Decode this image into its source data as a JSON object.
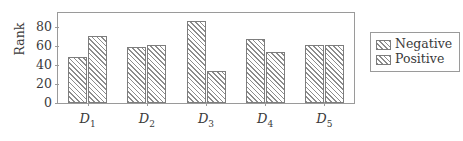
{
  "chart_data": {
    "type": "bar",
    "title": "",
    "xlabel": "",
    "ylabel": "Rank",
    "categories": [
      "D1",
      "D2",
      "D3",
      "D4",
      "D5"
    ],
    "category_labels": [
      "D",
      "D",
      "D",
      "D",
      "D"
    ],
    "category_subscripts": [
      "1",
      "2",
      "3",
      "4",
      "5"
    ],
    "series": [
      {
        "name": "Negative",
        "values": [
          49,
          59,
          87,
          68,
          61
        ]
      },
      {
        "name": "Positive",
        "values": [
          71,
          61,
          34,
          54,
          61
        ]
      }
    ],
    "ylim": [
      0,
      95
    ],
    "yticks": [
      0,
      20,
      40,
      60,
      80
    ],
    "ytick_labels": [
      "0",
      "20",
      "40",
      "60",
      "80"
    ],
    "grid": false,
    "legend_position": "right-outside",
    "legend_entries": [
      "Negative",
      "Positive"
    ],
    "frame_color": "#9a9a9a",
    "bar_edge_color": "#7d7d7d",
    "hatch_color": "#8c8c8c",
    "background_color": "#ffffff"
  }
}
